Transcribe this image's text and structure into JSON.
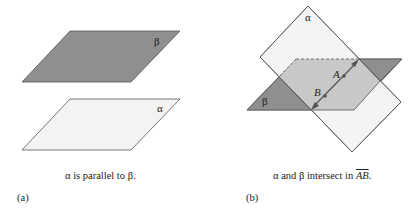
{
  "panel_a": {
    "id": "(a)",
    "caption": "α is parallel to β.",
    "plane_beta_label": "β",
    "plane_alpha_label": "α",
    "colors": {
      "beta_fill": "#8f8f8f",
      "alpha_fill": "#f3f3f3",
      "edge": "#555555"
    }
  },
  "panel_b": {
    "id": "(b)",
    "caption_prefix": "α and β intersect in",
    "caption_line": "AB",
    "caption_suffix": ".",
    "plane_alpha_label": "α",
    "plane_beta_label": "β",
    "point_a_label": "A",
    "point_b_label": "B",
    "colors": {
      "beta_fill": "#8f8f8f",
      "alpha_fill": "#f3f3f3",
      "overlap_fill": "#c8c8c8",
      "edge": "#555555"
    }
  }
}
